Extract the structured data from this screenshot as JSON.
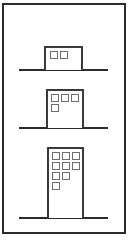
{
  "figure": {
    "title": "",
    "type": "diagram",
    "canvas": {
      "width": 136,
      "height": 246
    },
    "border": {
      "name": "figure-border",
      "x": 3,
      "y": 4,
      "width": 122,
      "height": 229,
      "stroke": "#2b2b2b",
      "stroke_width": 1.1,
      "fill": "#ffffff"
    },
    "colors": {
      "outline": "#3a3a3a",
      "ground": "#2b2b2b",
      "window_stroke": "#6e6e6e",
      "fill": "#ffffff",
      "border": "#2b2b2b"
    },
    "ground_lines": [
      {
        "name": "ground-line-top",
        "x1": 19,
        "x2": 108,
        "y": 70,
        "stroke_width": 1.6
      },
      {
        "name": "ground-line-middle",
        "x1": 19,
        "x2": 108,
        "y": 128,
        "stroke_width": 1.6
      },
      {
        "name": "ground-line-bottom",
        "x1": 19,
        "x2": 108,
        "y": 218,
        "stroke_width": 1.6
      }
    ],
    "buildings": [
      {
        "id": "building-1",
        "label": "Building 1",
        "stories": 1,
        "x": 45,
        "y": 47,
        "width": 37,
        "height": 23,
        "stroke_width": 1.4,
        "window_count": 2,
        "window_size": 7,
        "window_rows": [
          {
            "row": 1,
            "count": 2,
            "y": 51
          }
        ],
        "window_origin_x": 50,
        "window_gap": 10
      },
      {
        "id": "building-2",
        "label": "Building 2",
        "stories": 2,
        "x": 47,
        "y": 90,
        "width": 36,
        "height": 38,
        "stroke_width": 1.4,
        "window_count": 4,
        "window_size": 7,
        "window_rows": [
          {
            "row": 1,
            "count": 3,
            "y": 94
          },
          {
            "row": 2,
            "count": 1,
            "y": 104
          }
        ],
        "window_origin_x": 51,
        "window_gap": 10
      },
      {
        "id": "building-3",
        "label": "Building 3",
        "stories": 4,
        "x": 48,
        "y": 148,
        "width": 35,
        "height": 70,
        "stroke_width": 1.4,
        "window_count": 9,
        "window_size": 7,
        "window_rows": [
          {
            "row": 1,
            "count": 3,
            "y": 152
          },
          {
            "row": 2,
            "count": 3,
            "y": 162
          },
          {
            "row": 3,
            "count": 2,
            "y": 172
          },
          {
            "row": 4,
            "count": 1,
            "y": 182
          }
        ],
        "window_origin_x": 52,
        "window_gap": 10
      }
    ]
  }
}
